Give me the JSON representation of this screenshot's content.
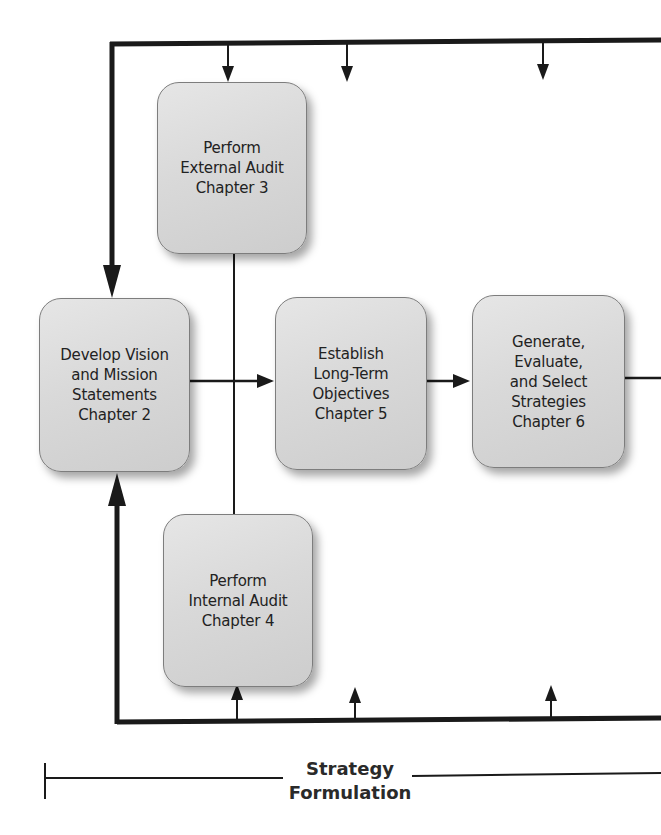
{
  "diagram": {
    "type": "process-flow",
    "boxes": [
      {
        "id": "external-audit",
        "label": "Perform\nExternal Audit\nChapter 3"
      },
      {
        "id": "vision-mission",
        "label": "Develop Vision\nand Mission\nStatements\nChapter 2"
      },
      {
        "id": "long-term-objectives",
        "label": "Establish\nLong-Term\nObjectives\nChapter 5"
      },
      {
        "id": "strategies",
        "label": "Generate,\nEvaluate,\nand Select\nStrategies\nChapter 6"
      },
      {
        "id": "internal-audit",
        "label": "Perform\nInternal Audit\nChapter 4"
      }
    ],
    "connections": [
      {
        "from": "vision-mission",
        "to": "long-term-objectives"
      },
      {
        "from": "long-term-objectives",
        "to": "strategies"
      },
      {
        "from": "strategies",
        "to": "off-canvas-right"
      },
      {
        "from": "external-audit",
        "to": "internal-audit",
        "type": "line"
      },
      {
        "from": "top-feedback-loop",
        "to": "vision-mission"
      },
      {
        "from": "bottom-feedback-loop",
        "to": "vision-mission"
      },
      {
        "from": "top-feedback-loop",
        "to": "external-audit"
      },
      {
        "from": "bottom-feedback-loop",
        "to": "internal-audit"
      }
    ],
    "footer": {
      "label": "Strategy\nFormulation"
    },
    "colors": {
      "line": "#1a1a1a",
      "box_fill": "#d9d9d9",
      "box_border": "#7d7d7d",
      "text": "#222222"
    }
  }
}
